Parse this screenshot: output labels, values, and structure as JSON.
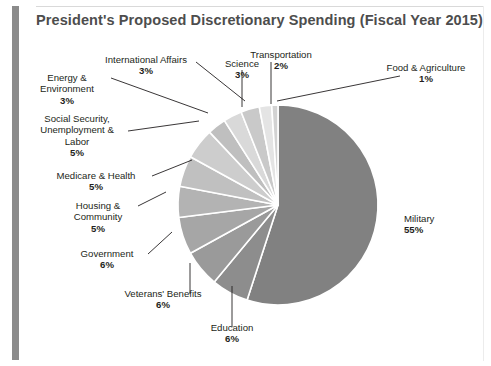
{
  "chart_title": "President's Proposed Discretionary Spending (Fiscal Year 2015)",
  "chart_data": {
    "type": "pie",
    "title": "President's Proposed Discretionary Spending (Fiscal Year 2015)",
    "xlabel": "",
    "ylabel": "",
    "units": "percent of total discretionary spending",
    "legend_position": "none",
    "labels_inline": true,
    "start_angle_deg": 0,
    "direction": "clockwise",
    "categories": [
      "Military",
      "Education",
      "Veterans' Benefits",
      "Government",
      "Housing & Community",
      "Medicare & Health",
      "Social Security, Unemployment & Labor",
      "Energy & Environment",
      "International Affairs",
      "Science",
      "Transportation",
      "Food & Agriculture"
    ],
    "values": [
      55,
      6,
      6,
      6,
      5,
      5,
      5,
      3,
      3,
      3,
      2,
      1
    ],
    "value_labels": [
      "55%",
      "6%",
      "6%",
      "6%",
      "5%",
      "5%",
      "5%",
      "3%",
      "3%",
      "3%",
      "2%",
      "1%"
    ],
    "slice_colors": [
      "#818181",
      "#8d8d8d",
      "#9a9a9a",
      "#a6a6a6",
      "#b3b3b3",
      "#c0c0c0",
      "#cdcdcd",
      "#bfbfbf",
      "#d9d9d9",
      "#c9c9c9",
      "#e4e4e4",
      "#d2d2d2"
    ]
  },
  "labels": {
    "military": {
      "name": "Military",
      "pct": "55%"
    },
    "education": {
      "name": "Education",
      "pct": "6%"
    },
    "veterans": {
      "name": "Veterans' Benefits",
      "pct": "6%"
    },
    "government": {
      "name": "Government",
      "pct": "6%"
    },
    "housing_l1": "Housing &",
    "housing_l2": "Community",
    "housing_pct": "5%",
    "medicare": {
      "name": "Medicare & Health",
      "pct": "5%"
    },
    "social_l1": "Social Security,",
    "social_l2": "Unemployment &",
    "social_l3": "Labor",
    "social_pct": "5%",
    "energy_l1": "Energy &",
    "energy_l2": "Environment",
    "energy_pct": "3%",
    "intl": {
      "name": "International Affairs",
      "pct": "3%"
    },
    "science": {
      "name": "Science",
      "pct": "3%"
    },
    "transportation": {
      "name": "Transportation",
      "pct": "2%"
    },
    "food_l1": "Food & Agriculture",
    "food_pct": "1%"
  },
  "colors": {
    "accent_bar": "#8b8b8b",
    "title_text": "#4d4d4d",
    "label_text": "#231f20",
    "leader_line": "#231f20",
    "slice_gap": "#ffffff",
    "background": "#ffffff"
  }
}
